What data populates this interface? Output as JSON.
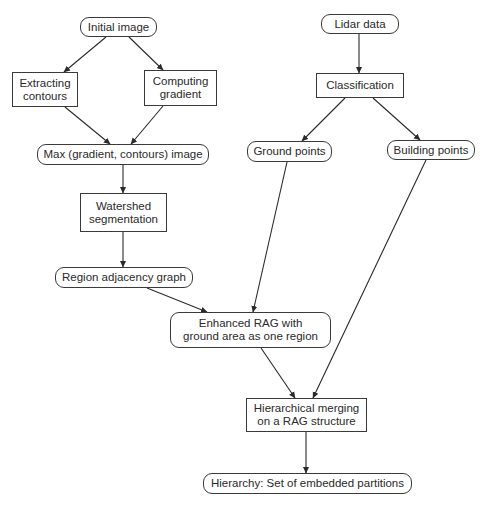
{
  "diagram": {
    "nodes": [
      {
        "id": "initial_image",
        "label": "Initial image",
        "shape": "rounded",
        "x": 80,
        "y": 17,
        "w": 77,
        "h": 20
      },
      {
        "id": "extracting_contours",
        "label": "Extracting\ncontours",
        "shape": "rect",
        "x": 12,
        "y": 72,
        "w": 66,
        "h": 35
      },
      {
        "id": "computing_gradient",
        "label": "Computing\ngradient",
        "shape": "rect",
        "x": 144,
        "y": 70,
        "w": 73,
        "h": 36
      },
      {
        "id": "max_image",
        "label": "Max (gradient, contours) image",
        "shape": "rounded",
        "x": 37,
        "y": 144,
        "w": 172,
        "h": 21
      },
      {
        "id": "watershed",
        "label": "Watershed\nsegmentation",
        "shape": "rect",
        "x": 80,
        "y": 193,
        "w": 87,
        "h": 39
      },
      {
        "id": "rag",
        "label": "Region adjacency graph",
        "shape": "rounded",
        "x": 55,
        "y": 267,
        "w": 138,
        "h": 21
      },
      {
        "id": "lidar_data",
        "label": "Lidar data",
        "shape": "rounded",
        "x": 321,
        "y": 14,
        "w": 78,
        "h": 20
      },
      {
        "id": "classification",
        "label": "Classification",
        "shape": "rect",
        "x": 316,
        "y": 73,
        "w": 88,
        "h": 25
      },
      {
        "id": "ground_points",
        "label": "Ground points",
        "shape": "rounded",
        "x": 247,
        "y": 141,
        "w": 85,
        "h": 21
      },
      {
        "id": "building_points",
        "label": "Building points",
        "shape": "rounded",
        "x": 387,
        "y": 140,
        "w": 88,
        "h": 20
      },
      {
        "id": "enhanced_rag",
        "label": "Enhanced RAG with\nground area as one region",
        "shape": "rounded",
        "x": 170,
        "y": 312,
        "w": 161,
        "h": 36
      },
      {
        "id": "hierarchical_merging",
        "label": "Hierarchical merging\non a RAG structure",
        "shape": "rect",
        "x": 246,
        "y": 398,
        "w": 121,
        "h": 34
      },
      {
        "id": "hierarchy",
        "label": "Hierarchy: Set of embedded partitions",
        "shape": "rounded",
        "x": 203,
        "y": 473,
        "w": 209,
        "h": 21
      }
    ],
    "edges": [
      {
        "from": "initial_image",
        "to": "extracting_contours",
        "x1": 106,
        "y1": 37,
        "x2": 64,
        "y2": 72
      },
      {
        "from": "initial_image",
        "to": "computing_gradient",
        "x1": 129,
        "y1": 37,
        "x2": 163,
        "y2": 70
      },
      {
        "from": "extracting_contours",
        "to": "max_image",
        "x1": 65,
        "y1": 107,
        "x2": 110,
        "y2": 144
      },
      {
        "from": "computing_gradient",
        "to": "max_image",
        "x1": 163,
        "y1": 106,
        "x2": 131,
        "y2": 144
      },
      {
        "from": "max_image",
        "to": "watershed",
        "x1": 123,
        "y1": 165,
        "x2": 123,
        "y2": 193
      },
      {
        "from": "watershed",
        "to": "rag",
        "x1": 123,
        "y1": 232,
        "x2": 123,
        "y2": 267
      },
      {
        "from": "lidar_data",
        "to": "classification",
        "x1": 359,
        "y1": 34,
        "x2": 359,
        "y2": 73
      },
      {
        "from": "classification",
        "to": "ground_points",
        "x1": 345,
        "y1": 98,
        "x2": 302,
        "y2": 141
      },
      {
        "from": "classification",
        "to": "building_points",
        "x1": 373,
        "y1": 98,
        "x2": 420,
        "y2": 140
      },
      {
        "from": "ground_points",
        "to": "enhanced_rag",
        "x1": 287,
        "y1": 162,
        "x2": 253,
        "y2": 312
      },
      {
        "from": "rag",
        "to": "enhanced_rag",
        "x1": 147,
        "y1": 288,
        "x2": 207,
        "y2": 312
      },
      {
        "from": "building_points",
        "to": "hierarchical_merging",
        "x1": 426,
        "y1": 160,
        "x2": 313,
        "y2": 398
      },
      {
        "from": "enhanced_rag",
        "to": "hierarchical_merging",
        "x1": 261,
        "y1": 348,
        "x2": 295,
        "y2": 398
      },
      {
        "from": "hierarchical_merging",
        "to": "hierarchy",
        "x1": 306,
        "y1": 432,
        "x2": 306,
        "y2": 473
      }
    ]
  }
}
